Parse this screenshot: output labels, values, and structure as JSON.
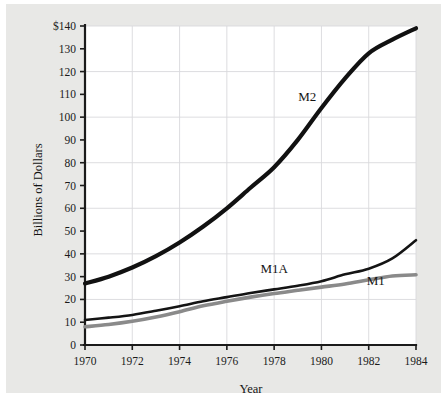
{
  "figure": {
    "background_color": "#e8e8e6",
    "plot_background_color": "#ffffff",
    "axis_color": "#1b1b1b",
    "grid_color": "#d9d9dd"
  },
  "chart_data": {
    "type": "line",
    "title": "",
    "xlabel": "Year",
    "ylabel": "Billions of Dollars",
    "xlim": [
      1970,
      1984
    ],
    "ylim": [
      0,
      140
    ],
    "grid": true,
    "legend_position": "inline-labels",
    "x": [
      1970,
      1971,
      1972,
      1973,
      1974,
      1975,
      1976,
      1977,
      1978,
      1979,
      1980,
      1981,
      1982,
      1983,
      1984
    ],
    "xtick_labels": [
      "1970",
      "1972",
      "1974",
      "1976",
      "1978",
      "1980",
      "1982",
      "1984"
    ],
    "xticks": [
      1970,
      1972,
      1974,
      1976,
      1978,
      1980,
      1982,
      1984
    ],
    "ytick_labels": [
      "0",
      "10",
      "20",
      "30",
      "40",
      "50",
      "60",
      "70",
      "80",
      "90",
      "100",
      "110",
      "120",
      "130",
      "$140"
    ],
    "yticks": [
      0,
      10,
      20,
      30,
      40,
      50,
      60,
      70,
      80,
      90,
      100,
      110,
      120,
      130,
      140
    ],
    "gridlines_y": [
      20,
      40,
      60,
      80,
      100,
      120,
      140
    ],
    "gridlines_x": [
      1972,
      1974,
      1976,
      1978,
      1980,
      1982,
      1984
    ],
    "series": [
      {
        "name": "M2",
        "label": "M2",
        "color": "#111111",
        "width": 4.2,
        "label_x": 1979.4,
        "label_y": 107,
        "values": [
          27,
          30,
          34,
          39,
          45,
          52,
          60,
          69,
          78,
          90,
          104,
          117,
          128,
          134,
          139
        ]
      },
      {
        "name": "M1A",
        "label": "M1A",
        "color": "#141414",
        "width": 2.6,
        "label_x": 1978.0,
        "label_y": 31.5,
        "values": [
          11,
          12,
          13.2,
          15,
          17,
          19.2,
          21,
          22.8,
          24.4,
          26,
          28,
          31,
          33.5,
          38,
          46
        ]
      },
      {
        "name": "M1",
        "label": "M1",
        "color": "#8a8a8a",
        "width": 3.6,
        "label_x": 1982.3,
        "label_y": 26.5,
        "values": [
          8,
          9,
          10.4,
          12.3,
          14.6,
          17.2,
          19.2,
          21,
          22.6,
          24,
          25.4,
          26.8,
          28.6,
          30.3,
          30.8
        ]
      }
    ]
  }
}
